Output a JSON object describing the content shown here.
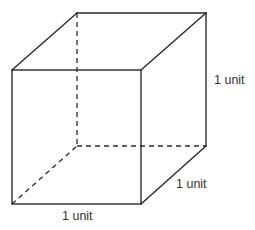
{
  "figure": {
    "shape": "cube",
    "labels": {
      "height": "1 unit",
      "depth": "1 unit",
      "width": "1 unit"
    },
    "colors": {
      "line": "#2a2a2a",
      "text": "#333333",
      "background": "#ffffff"
    }
  }
}
